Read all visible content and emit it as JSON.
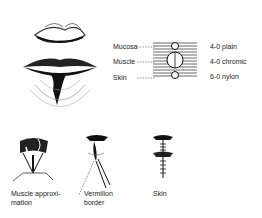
{
  "figure": {
    "main_illustration": "lips-with-laceration",
    "layer_diagram": {
      "layers": [
        {
          "label": "Mucosa",
          "suture": "4-0 plain"
        },
        {
          "label": "Muscle",
          "suture": "4-0 chromic"
        },
        {
          "label": "Skin",
          "suture": "6-0 nylon"
        }
      ]
    },
    "steps": [
      {
        "line1": "Muscle approxi-",
        "line2": "mation"
      },
      {
        "line1": "Vermilion",
        "line2": "border"
      },
      {
        "line1": "Skin",
        "line2": ""
      }
    ]
  }
}
